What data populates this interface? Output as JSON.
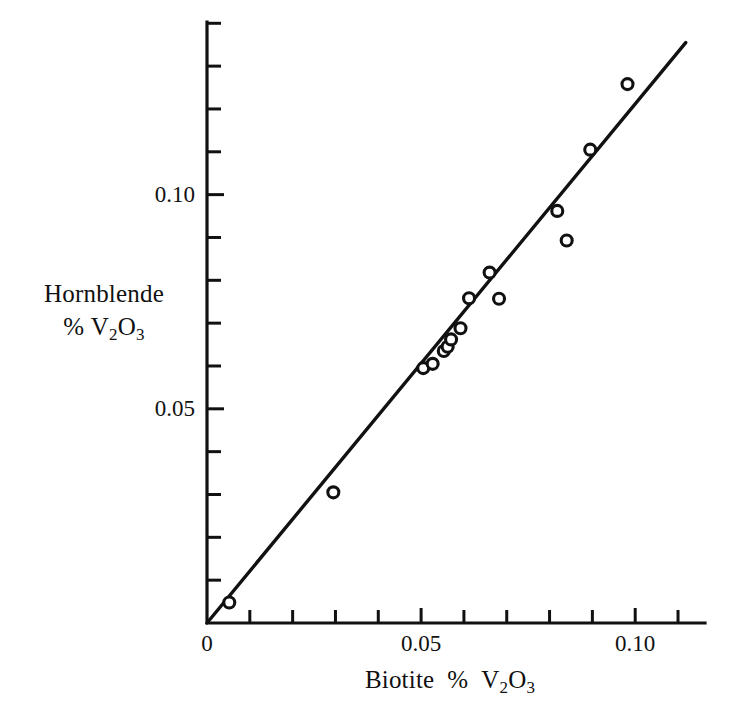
{
  "chart_data": {
    "type": "scatter",
    "title": "",
    "subtitle": "",
    "xlabel": "Biotite  % V2O3",
    "xlabel_parts": {
      "pre": "Biotite",
      "percent": "%",
      "v": "V",
      "sub1": "2",
      "o": "O",
      "sub2": "3"
    },
    "ylabel": "Hornblende % V2O3",
    "ylabel_line1": "Hornblende",
    "ylabel_line2_parts": {
      "percent": "%",
      "v": "V",
      "sub1": "2",
      "o": "O",
      "sub2": "3"
    },
    "xlim": [
      0,
      0.1163
    ],
    "ylim": [
      0,
      0.1403
    ],
    "xticks_major": [
      0,
      0.05,
      0.1
    ],
    "xticklabels": [
      "0",
      "0.05",
      "0.10"
    ],
    "yticks_major": [
      0.05,
      0.1
    ],
    "yticklabels": [
      "0.05",
      "0.10"
    ],
    "xtick_minor_step": 0.01,
    "ytick_minor_step": 0.01,
    "grid": false,
    "legend": null,
    "marker": "open-circle",
    "marker_size": 11,
    "points": [
      {
        "x": 0.0052,
        "y": 0.0048
      },
      {
        "x": 0.0295,
        "y": 0.0305
      },
      {
        "x": 0.0505,
        "y": 0.0595
      },
      {
        "x": 0.0527,
        "y": 0.0605
      },
      {
        "x": 0.0553,
        "y": 0.0635
      },
      {
        "x": 0.0562,
        "y": 0.0645
      },
      {
        "x": 0.057,
        "y": 0.0662
      },
      {
        "x": 0.0592,
        "y": 0.0688
      },
      {
        "x": 0.0612,
        "y": 0.0758
      },
      {
        "x": 0.066,
        "y": 0.0818
      },
      {
        "x": 0.0682,
        "y": 0.0757
      },
      {
        "x": 0.0818,
        "y": 0.0962
      },
      {
        "x": 0.084,
        "y": 0.0893
      },
      {
        "x": 0.0895,
        "y": 0.1105
      },
      {
        "x": 0.0982,
        "y": 0.1258
      }
    ],
    "fit_line": {
      "x0": 0.0,
      "y0": 0.0,
      "x1": 0.1118,
      "y1": 0.1355
    },
    "colors": {
      "ink": "#111111",
      "background": "#ffffff"
    }
  },
  "axes_geometry": {
    "plot_left_px": 207,
    "plot_right_px": 705,
    "plot_top_px": 22,
    "plot_bottom_px": 623
  }
}
